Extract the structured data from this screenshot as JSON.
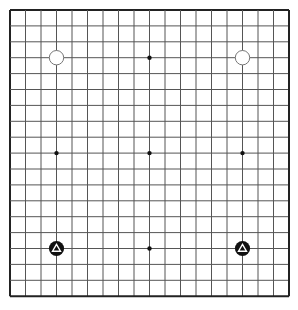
{
  "board": {
    "size": 19,
    "origin": {
      "x": 10,
      "y": 10
    },
    "spacing": {
      "x": 15.5,
      "y": 15.9
    },
    "colors": {
      "background": "#ffffff",
      "grid_line": "#555555",
      "border_line": "#222222",
      "star_point": "#111111",
      "black_stone": "#111111",
      "white_stone_fill": "#ffffff",
      "white_stone_stroke": "#777777",
      "marker_on_black": "#ffffff"
    },
    "star_points": [
      {
        "col": 9,
        "row": 3
      },
      {
        "col": 3,
        "row": 9
      },
      {
        "col": 9,
        "row": 9
      },
      {
        "col": 15,
        "row": 9
      },
      {
        "col": 9,
        "row": 15
      }
    ],
    "stones": [
      {
        "color": "white",
        "col": 3,
        "row": 3,
        "marker": null
      },
      {
        "color": "white",
        "col": 15,
        "row": 3,
        "marker": null
      },
      {
        "color": "black",
        "col": 3,
        "row": 15,
        "marker": "triangle"
      },
      {
        "color": "black",
        "col": 15,
        "row": 15,
        "marker": "triangle"
      }
    ]
  }
}
